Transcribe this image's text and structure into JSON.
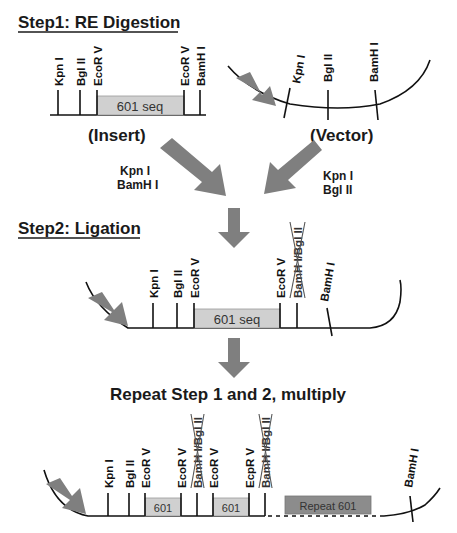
{
  "step1": {
    "title": "Step1: RE Digestion",
    "insert": {
      "label": "(Insert)",
      "sites": [
        "Kpn I",
        "Bgl II",
        "EcoR V",
        "EcoR V",
        "BamH I"
      ],
      "sequence_label": "601 seq"
    },
    "vector": {
      "label": "(Vector)",
      "sites": [
        "Kpn I",
        "Bgl II",
        "BamH I"
      ]
    },
    "insert_enzymes": [
      "Kpn I",
      "BamH I"
    ],
    "vector_enzymes": [
      "Kpn I",
      "Bgl II"
    ]
  },
  "step2": {
    "title": "Step2: Ligation",
    "sites": [
      "Kpn I",
      "Bgl II",
      "EcoR V",
      "EcoR V",
      "BamH I/Bgl II",
      "BamH I"
    ],
    "struck_site": "BamH I/Bgl II",
    "sequence_label": "601 seq"
  },
  "repeat": {
    "title": "Repeat Step 1 and 2, multiply",
    "sites": [
      "Kpn I",
      "Bgl II",
      "EcoR V",
      "EcoR V",
      "BamH I/Bgl II",
      "EcoR V",
      "EcpR V",
      "BamH I/Bgl II",
      "BamH I"
    ],
    "unit_label_1": "601",
    "unit_label_2": "601",
    "repeat_label": "Repeat 601"
  },
  "colors": {
    "arrow": "#7f7f7f",
    "sequence_box": "#d0d0d0",
    "repeat_box": "#8c8c8c",
    "text": "#1a1a1a"
  }
}
